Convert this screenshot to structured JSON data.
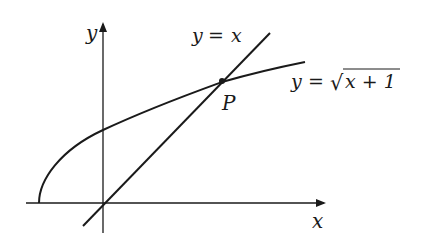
{
  "diagram": {
    "axes": {
      "x_label": "x",
      "y_label": "y"
    },
    "curves": [
      {
        "id": "line",
        "equation_lhs": "y",
        "equals": "=",
        "equation_rhs": "x"
      },
      {
        "id": "sqrt",
        "equation_lhs": "y",
        "equals": "=",
        "equation_rhs": "x + 1",
        "radical": "√"
      }
    ],
    "points": [
      {
        "label": "P"
      }
    ],
    "colors": {
      "stroke": "#1a1a1a",
      "background": "#ffffff"
    }
  }
}
